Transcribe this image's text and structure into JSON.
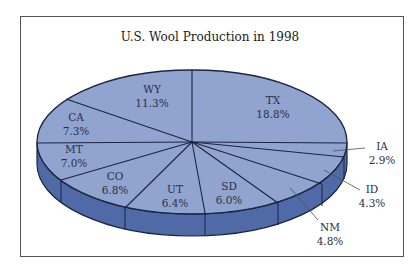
{
  "chart_data": {
    "type": "pie",
    "title": "U.S. Wool Production in 1998",
    "style": "3d",
    "categories": [
      "TX",
      "WY",
      "CA",
      "MT",
      "CO",
      "UT",
      "SD",
      "NM",
      "ID",
      "IA"
    ],
    "values": [
      18.8,
      11.3,
      7.3,
      7.0,
      6.8,
      6.4,
      6.0,
      4.8,
      4.3,
      2.9
    ],
    "unit": "%",
    "labels": [
      "18.8%",
      "11.3%",
      "7.3%",
      "7.0%",
      "6.8%",
      "6.4%",
      "6.0%",
      "4.8%",
      "4.3%",
      "2.9%"
    ],
    "note": "Remaining share not labeled"
  },
  "colors": {
    "top_face": "#91a4d0",
    "side_wall": "#4f6aa6",
    "edge": "#1b2440",
    "frame": "#555555"
  },
  "geometry": {
    "cx": 192,
    "cy": 142,
    "rx": 155,
    "ry": 72,
    "depth": 22,
    "boundaries": [
      [
        347,
        143
      ],
      [
        192,
        70
      ],
      [
        66,
        99
      ],
      [
        37,
        143
      ],
      [
        61,
        180
      ],
      [
        125,
        208
      ],
      [
        205,
        213
      ],
      [
        278,
        203
      ],
      [
        322,
        184
      ],
      [
        344,
        157
      ]
    ]
  },
  "slice_labels": [
    {
      "name": "TX",
      "pct": "18.8%",
      "x": 273,
      "y": 104,
      "leader": null
    },
    {
      "name": "WY",
      "pct": "11.3%",
      "x": 152,
      "y": 93,
      "leader": null
    },
    {
      "name": "CA",
      "pct": "7.3%",
      "x": 76,
      "y": 121,
      "leader": null
    },
    {
      "name": "MT",
      "pct": "7.0%",
      "x": 74,
      "y": 153,
      "leader": null
    },
    {
      "name": "CO",
      "pct": "6.8%",
      "x": 115,
      "y": 180,
      "leader": null
    },
    {
      "name": "UT",
      "pct": "6.4%",
      "x": 175,
      "y": 193,
      "leader": null
    },
    {
      "name": "SD",
      "pct": "6.0%",
      "x": 229,
      "y": 190,
      "leader": null
    },
    {
      "name": "NM",
      "pct": "4.8%",
      "x": 330,
      "y": 231,
      "leader": [
        290,
        188,
        318,
        220
      ]
    },
    {
      "name": "ID",
      "pct": "4.3%",
      "x": 372,
      "y": 193,
      "leader": [
        324,
        170,
        360,
        190
      ]
    },
    {
      "name": "IA",
      "pct": "2.9%",
      "x": 382,
      "y": 150,
      "leader": [
        333,
        151,
        365,
        148
      ]
    }
  ]
}
